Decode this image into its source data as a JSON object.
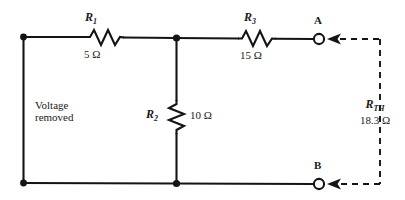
{
  "diagram": {
    "source_note": {
      "line1": "Voltage",
      "line2": "removed"
    },
    "components": [
      {
        "id": "R1",
        "name": "R",
        "subscript": "1",
        "value": "5 Ω",
        "orientation": "horizontal"
      },
      {
        "id": "R2",
        "name": "R",
        "subscript": "2",
        "value": "10 Ω",
        "orientation": "vertical"
      },
      {
        "id": "R3",
        "name": "R",
        "subscript": "3",
        "value": "15 Ω",
        "orientation": "horizontal"
      }
    ],
    "terminals": [
      {
        "id": "A",
        "label": "A"
      },
      {
        "id": "B",
        "label": "B"
      }
    ],
    "thevenin": {
      "name": "R",
      "subscript": "TH",
      "value": "18.3 Ω"
    },
    "colors": {
      "wire": "#141414",
      "text": "#1a1a1a",
      "background": "#ffffff"
    }
  }
}
